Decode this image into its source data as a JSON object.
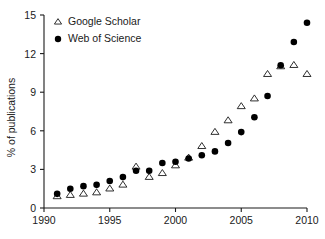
{
  "chart_data": {
    "type": "scatter",
    "title": "",
    "xlabel": "",
    "ylabel": "% of publications",
    "xlim": [
      1990,
      2010
    ],
    "ylim": [
      0,
      15
    ],
    "grid": false,
    "legend_position": "top-left",
    "x_ticks": [
      "1990",
      "1995",
      "2000",
      "2005",
      "2010"
    ],
    "x_tick_values": [
      1990,
      1995,
      2000,
      2005,
      2010
    ],
    "y_ticks": [
      "0",
      "3",
      "6",
      "9",
      "12",
      "15"
    ],
    "y_tick_values": [
      0,
      3,
      6,
      9,
      12,
      15
    ],
    "x": [
      1991,
      1992,
      1993,
      1994,
      1995,
      1996,
      1997,
      1998,
      1999,
      2000,
      2001,
      2002,
      2003,
      2004,
      2005,
      2006,
      2007,
      2008,
      2009,
      2010
    ],
    "series": [
      {
        "name": "Google Scholar",
        "marker": "open-triangle",
        "color": "#ffffff",
        "edge_color": "#1a1a1a",
        "values": [
          0.9,
          1.0,
          1.1,
          1.2,
          1.5,
          1.8,
          3.2,
          2.4,
          2.7,
          3.3,
          3.9,
          4.8,
          5.9,
          6.8,
          7.9,
          8.5,
          10.4,
          11.0,
          11.1,
          10.4
        ]
      },
      {
        "name": "Web of Science",
        "marker": "filled-circle",
        "color": "#000000",
        "edge_color": "#000000",
        "values": [
          1.1,
          1.5,
          1.7,
          1.8,
          2.1,
          2.4,
          2.9,
          2.9,
          3.5,
          3.6,
          3.85,
          4.1,
          4.4,
          5.05,
          5.9,
          7.05,
          8.7,
          11.1,
          12.9,
          14.4
        ]
      }
    ]
  },
  "legend": {
    "items": [
      {
        "label": "Google Scholar",
        "marker": "open-triangle"
      },
      {
        "label": "Web of Science",
        "marker": "filled-circle"
      }
    ]
  }
}
